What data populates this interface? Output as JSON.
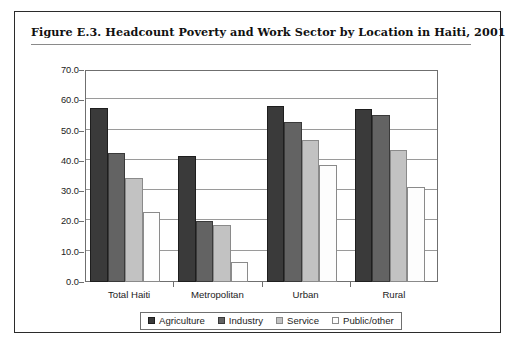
{
  "figure": {
    "title": "Figure E.3.  Headcount Poverty and Work Sector by Location in Haiti, 2001"
  },
  "chart_data": {
    "type": "bar",
    "title": "Figure E.3.  Headcount Poverty and Work Sector by Location in Haiti, 2001",
    "xlabel": "",
    "ylabel": "",
    "ylim": [
      0,
      70
    ],
    "ytick_labels": [
      "70.0",
      "60.0",
      "50.0",
      "40.0",
      "30.0",
      "20.0",
      "10.0",
      "0.0"
    ],
    "ytick_values": [
      70,
      60,
      50,
      40,
      30,
      20,
      10,
      0
    ],
    "grid": true,
    "legend_position": "bottom",
    "categories": [
      "Total Haiti",
      "Metropolitan",
      "Urban",
      "Rural"
    ],
    "series": [
      {
        "name": "Agriculture",
        "color": "#3a3a3a",
        "border": "#1e1e1e",
        "values": [
          57.5,
          41.5,
          58.0,
          57.0
        ]
      },
      {
        "name": "Industry",
        "color": "#636363",
        "border": "#3a3a3a",
        "values": [
          42.5,
          20.0,
          53.0,
          55.0
        ]
      },
      {
        "name": "Service",
        "color": "#c2c2c2",
        "border": "#8a8a8a",
        "values": [
          34.5,
          18.7,
          47.0,
          43.5
        ]
      },
      {
        "name": "Public/other",
        "color": "#fdfdfd",
        "border": "#8a8a8a",
        "values": [
          23.0,
          6.7,
          38.5,
          31.5
        ]
      }
    ]
  }
}
